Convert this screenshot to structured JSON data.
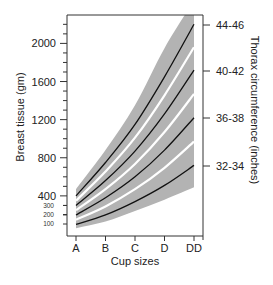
{
  "chart_data": {
    "type": "line",
    "title": "",
    "xlabel": "Cup sizes",
    "ylabel": "Breast tissue (gm)",
    "y2label": "Thorax circumference (inches)",
    "categories": [
      "A",
      "B",
      "C",
      "D",
      "DD"
    ],
    "ylim": [
      0,
      2400
    ],
    "y_ticks_major": [
      400,
      800,
      1200,
      1600,
      2000
    ],
    "y_ticks_minor_labels": [
      100,
      200,
      300
    ],
    "y2_ticks": [
      "32-34",
      "36-38",
      "40-42",
      "44-46"
    ],
    "grid": false,
    "legend": "none",
    "series": [
      {
        "name": "44-46",
        "values": [
          400,
          750,
          1150,
          1650,
          2200
        ]
      },
      {
        "name": "40-42",
        "values": [
          300,
          560,
          870,
          1260,
          1720
        ]
      },
      {
        "name": "36-38",
        "values": [
          200,
          380,
          600,
          880,
          1220
        ]
      },
      {
        "name": "32-34",
        "values": [
          100,
          200,
          340,
          510,
          720
        ]
      }
    ],
    "band": {
      "upper": [
        470,
        880,
        1350,
        1950,
        2450
      ],
      "lower": [
        60,
        130,
        240,
        360,
        490
      ]
    },
    "separators": [
      {
        "values": [
          350,
          655,
          1010,
          1455,
          1960
        ]
      },
      {
        "values": [
          250,
          470,
          735,
          1070,
          1470
        ]
      },
      {
        "values": [
          150,
          290,
          470,
          695,
          970
        ]
      }
    ],
    "colors": {
      "band": "#b3b3b3",
      "curve": "#111111",
      "separator": "#ffffff",
      "axis": "#333333"
    }
  }
}
